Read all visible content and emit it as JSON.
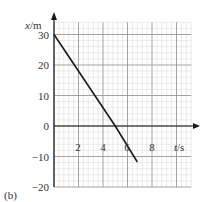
{
  "chart_data": {
    "type": "line",
    "title": "",
    "panel_label": "(b)",
    "xlabel": "t/s",
    "ylabel": "x/m",
    "xlim": [
      0,
      11.2
    ],
    "ylim": [
      -20,
      34
    ],
    "x_ticks": [
      2,
      4,
      6,
      8
    ],
    "y_ticks": [
      30,
      20,
      10,
      0,
      -10,
      -20
    ],
    "grid": true,
    "minor_grid_per_major": 5,
    "legend": null,
    "series": [
      {
        "name": "x(t)",
        "x": [
          0,
          5,
          6.8
        ],
        "values": [
          30,
          0,
          -11.8
        ]
      }
    ]
  },
  "labels": {
    "panel": "(b)",
    "xaxis": "t/s",
    "yaxis_var": "x",
    "yaxis_unit": "/m",
    "xaxis_var": "t",
    "xaxis_unit": "/s",
    "yticks": [
      "30",
      "20",
      "10",
      "0",
      "−10",
      "−20"
    ],
    "xticks": [
      "2",
      "4",
      "6",
      "8"
    ]
  },
  "colors": {
    "line": "#1a1a1a",
    "major_grid": "#9a9a9a",
    "minor_grid": "#d6d6d6",
    "axis": "#1a1a1a"
  }
}
